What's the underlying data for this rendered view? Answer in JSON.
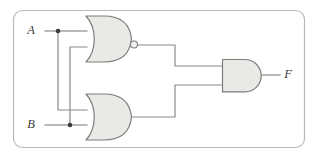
{
  "diagram": {
    "frame": {
      "name": "figure-border",
      "x": 13,
      "y": 10,
      "width": 292,
      "height": 138,
      "radius": 9,
      "stroke": "#b9b9b9"
    },
    "colors": {
      "gate_fill": "#e9e9e6",
      "gate_stroke": "#7d7d7d",
      "wire": "#8a8a8a",
      "junction": "#3a3a3a",
      "label": "#3c3c3c",
      "frame": "#b9b9b9",
      "background": "#ffffff"
    },
    "labels": [
      {
        "id": "input-a",
        "text": "A",
        "x": 34,
        "y": 31,
        "role": "input"
      },
      {
        "id": "input-b",
        "text": "B",
        "x": 34,
        "y": 125,
        "role": "input"
      },
      {
        "id": "output-f",
        "text": "F",
        "x": 286,
        "y": 75,
        "role": "output"
      }
    ],
    "gates": [
      {
        "id": "gate-nor-1",
        "type": "NOR",
        "label": "NOR",
        "inverted": true,
        "x": 85,
        "y": 16,
        "width": 46,
        "height": 46,
        "inputs": [
          {
            "name": "a",
            "signal": "A",
            "x": 85,
            "y": 31
          },
          {
            "name": "b",
            "signal": "B",
            "x": 85,
            "y": 47
          }
        ],
        "output": {
          "name": "y",
          "x": 137,
          "y": 45
        },
        "bubble": {
          "cx": 133.5,
          "cy": 45,
          "r": 3.6
        }
      },
      {
        "id": "gate-or-1",
        "type": "OR",
        "label": "OR",
        "inverted": false,
        "x": 85,
        "y": 94,
        "width": 46,
        "height": 46,
        "inputs": [
          {
            "name": "a",
            "signal": "A",
            "x": 85,
            "y": 110
          },
          {
            "name": "b",
            "signal": "B",
            "x": 85,
            "y": 125
          }
        ],
        "output": {
          "name": "y",
          "x": 131,
          "y": 117
        }
      },
      {
        "id": "gate-and-1",
        "type": "AND",
        "label": "AND",
        "inverted": false,
        "x": 222,
        "y": 59,
        "width": 40,
        "height": 33,
        "inputs": [
          {
            "name": "a",
            "signal": "NOR out",
            "x": 222,
            "y": 66
          },
          {
            "name": "b",
            "signal": "OR out",
            "x": 222,
            "y": 85
          }
        ],
        "output": {
          "name": "F",
          "x": 262,
          "y": 75
        }
      }
    ],
    "junctions": [
      {
        "id": "junction-a",
        "signal": "A",
        "x": 58,
        "y": 31,
        "r": 2.2
      },
      {
        "id": "junction-b",
        "signal": "B",
        "x": 70,
        "y": 125,
        "r": 2.2
      }
    ],
    "wires": [
      {
        "id": "wire-a-stub",
        "from": "A label",
        "to": "junction A",
        "d": "M 45 31 L 58 31"
      },
      {
        "id": "wire-a-to-nor-top",
        "from": "junction A",
        "to": "NOR input a",
        "d": "M 58 31 L 86 31"
      },
      {
        "id": "wire-a-down-to-or",
        "from": "junction A",
        "to": "OR input a",
        "d": "M 58 31 L 58 110 L 86 110"
      },
      {
        "id": "wire-b-stub",
        "from": "B label",
        "to": "junction B",
        "d": "M 45 125 L 70 125"
      },
      {
        "id": "wire-b-to-or-bot",
        "from": "junction B",
        "to": "OR input b",
        "d": "M 70 125 L 86 125"
      },
      {
        "id": "wire-b-up-to-nor",
        "from": "junction B",
        "to": "NOR input b",
        "d": "M 70 125 L 70 47 L 86 47"
      },
      {
        "id": "wire-nor-to-and",
        "from": "NOR output",
        "to": "AND input a",
        "d": "M 137 45 L 175 45 L 175 66 L 222 66"
      },
      {
        "id": "wire-or-to-and",
        "from": "OR output",
        "to": "AND input b",
        "d": "M 131 117 L 175 117 L 175 85 L 222 85"
      },
      {
        "id": "wire-and-to-f",
        "from": "AND output",
        "to": "F label",
        "d": "M 262 75 L 280 75"
      }
    ],
    "expression": "F = (A NOR B) AND (A OR B)"
  }
}
